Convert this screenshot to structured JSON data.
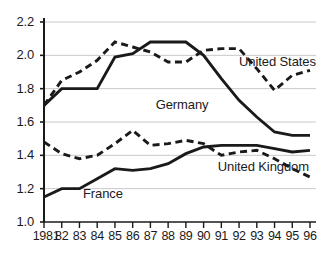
{
  "chart_data": {
    "type": "line",
    "title": "",
    "xlabel": "",
    "ylabel": "",
    "x": [
      1981,
      1982,
      1983,
      1984,
      1985,
      1986,
      1987,
      1988,
      1989,
      1990,
      1991,
      1992,
      1993,
      1994,
      1995,
      1996
    ],
    "xtick_labels": [
      "1981",
      "82",
      "83",
      "84",
      "85",
      "86",
      "87",
      "88",
      "89",
      "90",
      "91",
      "92",
      "93",
      "94",
      "95",
      "96"
    ],
    "ytick_labels": [
      "2.2",
      "2.0",
      "1.8",
      "1.6",
      "1.4",
      "1.2",
      "1.0"
    ],
    "ytick_values": [
      2.2,
      2.0,
      1.8,
      1.6,
      1.4,
      1.2,
      1.0
    ],
    "ylim": [
      1.0,
      2.2
    ],
    "xlim": [
      1981,
      1996
    ],
    "grid": true,
    "legend": "inline-annotations",
    "series": [
      {
        "name": "Germany",
        "style": "solid",
        "color": "#1a1a1a",
        "values": [
          1.7,
          1.8,
          1.8,
          1.8,
          1.99,
          2.01,
          2.08,
          2.08,
          2.08,
          2.0,
          1.86,
          1.73,
          1.63,
          1.54,
          1.52,
          1.52
        ]
      },
      {
        "name": "United States",
        "style": "dashed",
        "color": "#1a1a1a",
        "values": [
          1.7,
          1.85,
          1.9,
          1.97,
          2.08,
          2.05,
          2.02,
          1.96,
          1.96,
          2.03,
          2.04,
          2.04,
          1.92,
          1.79,
          1.88,
          1.91
        ]
      },
      {
        "name": "United Kingdom",
        "style": "dashed",
        "color": "#1a1a1a",
        "values": [
          1.48,
          1.41,
          1.38,
          1.4,
          1.47,
          1.55,
          1.46,
          1.47,
          1.49,
          1.47,
          1.4,
          1.42,
          1.43,
          1.38,
          1.32,
          1.27
        ]
      },
      {
        "name": "France",
        "style": "solid",
        "color": "#1a1a1a",
        "values": [
          1.15,
          1.2,
          1.2,
          1.26,
          1.32,
          1.31,
          1.32,
          1.35,
          1.41,
          1.45,
          1.46,
          1.46,
          1.46,
          1.44,
          1.42,
          1.43
        ]
      }
    ],
    "annotations": [
      {
        "text": "United States",
        "x": 1992.0,
        "y": 1.96
      },
      {
        "text": "Germany",
        "x": 1987.3,
        "y": 1.7
      },
      {
        "text": "United Kingdom",
        "x": 1990.8,
        "y": 1.33
      },
      {
        "text": "France",
        "x": 1983.2,
        "y": 1.17
      }
    ]
  },
  "axis": {
    "ytick_labels": [
      "2.2",
      "2.0",
      "1.8",
      "1.6",
      "1.4",
      "1.2",
      "1.0"
    ],
    "xtick_labels": [
      "1981",
      "82",
      "83",
      "84",
      "85",
      "86",
      "87",
      "88",
      "89",
      "90",
      "91",
      "92",
      "93",
      "94",
      "95",
      "96"
    ]
  },
  "labels": {
    "united_states": "United States",
    "germany": "Germany",
    "united_kingdom": "United Kingdom",
    "france": "France"
  },
  "colors": {
    "line": "#1a1a1a",
    "grid": "#c8c8c8",
    "axis": "#1a1a1a",
    "background": "#ffffff"
  }
}
